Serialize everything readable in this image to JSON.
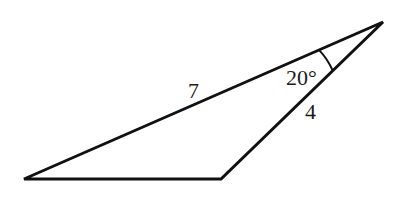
{
  "diagram": {
    "type": "triangle",
    "vertices": {
      "A": [
        24,
        179
      ],
      "B": [
        221,
        179
      ],
      "C": [
        383,
        22
      ]
    },
    "labels": {
      "side_AC": "7",
      "side_BC": "4",
      "angle_C": "20°"
    },
    "colors": {
      "stroke": "#111111",
      "background": "#ffffff"
    }
  }
}
